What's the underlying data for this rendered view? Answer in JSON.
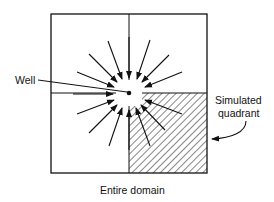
{
  "diagram": {
    "labels": {
      "well": "Well",
      "simulated_quadrant_line1": "Simulated",
      "simulated_quadrant_line2": "quadrant",
      "caption": "Entire domain"
    },
    "colors": {
      "stroke": "#111111",
      "background": "#ffffff"
    },
    "domain_box": {
      "x": 51,
      "y": 14,
      "width": 156,
      "height": 159
    },
    "well_center": {
      "x": 129,
      "y": 93
    },
    "hatched_quadrant": "bottom-right"
  }
}
